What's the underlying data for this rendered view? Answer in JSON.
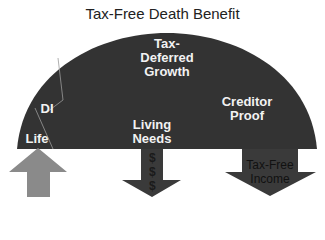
{
  "title": "Tax-Free Death Benefit",
  "dome": {
    "color": "#333333",
    "segments": [
      {
        "label": "Life"
      },
      {
        "label": "DI"
      },
      {
        "label_lines": [
          "Tax-",
          "Deferred",
          "Growth"
        ]
      },
      {
        "label_lines": [
          "Creditor",
          "Proof"
        ]
      },
      {
        "label_lines": [
          "Living",
          "Needs"
        ]
      }
    ]
  },
  "arrows": [
    {
      "name": "life-input",
      "direction": "up",
      "color": "#8a8a8a"
    },
    {
      "name": "living-needs-output",
      "direction": "down",
      "color": "#3a3a3a",
      "symbols": [
        "$",
        "$",
        "$"
      ]
    },
    {
      "name": "tax-free-income-output",
      "direction": "down",
      "color": "#3a3a3a",
      "label_lines": [
        "Tax-Free",
        "Income"
      ]
    }
  ]
}
